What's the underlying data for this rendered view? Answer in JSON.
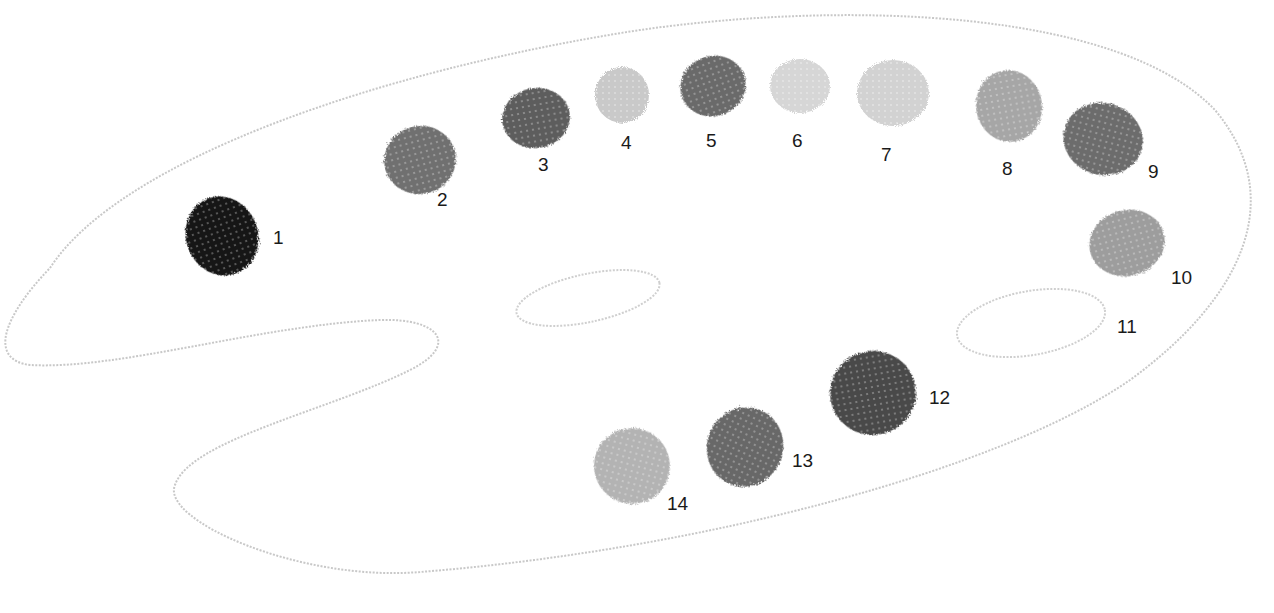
{
  "palette": {
    "outline_color": "#c8c8c8",
    "background": "#ffffff"
  },
  "swatches": [
    {
      "number": "1",
      "color": "#151515",
      "cx": 222,
      "cy": 236,
      "rx": 36,
      "ry": 40,
      "rot": -20,
      "label_x": 273,
      "label_y": 228
    },
    {
      "number": "2",
      "color": "#6f6f6f",
      "cx": 420,
      "cy": 160,
      "rx": 36,
      "ry": 34,
      "rot": -15,
      "label_x": 437,
      "label_y": 190
    },
    {
      "number": "3",
      "color": "#5d5d5d",
      "cx": 536,
      "cy": 118,
      "rx": 34,
      "ry": 30,
      "rot": -10,
      "label_x": 538,
      "label_y": 155
    },
    {
      "number": "4",
      "color": "#c9c9c9",
      "cx": 622,
      "cy": 95,
      "rx": 27,
      "ry": 28,
      "rot": 0,
      "label_x": 621,
      "label_y": 133
    },
    {
      "number": "5",
      "color": "#6a6a6a",
      "cx": 713,
      "cy": 86,
      "rx": 33,
      "ry": 30,
      "rot": -20,
      "label_x": 706,
      "label_y": 131
    },
    {
      "number": "6",
      "color": "#d6d6d6",
      "cx": 800,
      "cy": 86,
      "rx": 30,
      "ry": 27,
      "rot": 0,
      "label_x": 792,
      "label_y": 131
    },
    {
      "number": "7",
      "color": "#d2d2d2",
      "cx": 893,
      "cy": 93,
      "rx": 36,
      "ry": 33,
      "rot": 0,
      "label_x": 881,
      "label_y": 145
    },
    {
      "number": "8",
      "color": "#a6a6a6",
      "cx": 1009,
      "cy": 106,
      "rx": 33,
      "ry": 36,
      "rot": -10,
      "label_x": 1002,
      "label_y": 159
    },
    {
      "number": "9",
      "color": "#6c6c6c",
      "cx": 1103,
      "cy": 139,
      "rx": 40,
      "ry": 36,
      "rot": 15,
      "label_x": 1148,
      "label_y": 162
    },
    {
      "number": "10",
      "color": "#9d9d9d",
      "cx": 1127,
      "cy": 243,
      "rx": 38,
      "ry": 33,
      "rot": -15,
      "label_x": 1171,
      "label_y": 268
    },
    {
      "number": "12",
      "color": "#484848",
      "cx": 873,
      "cy": 393,
      "rx": 43,
      "ry": 42,
      "rot": -10,
      "label_x": 929,
      "label_y": 388
    },
    {
      "number": "13",
      "color": "#676767",
      "cx": 745,
      "cy": 447,
      "rx": 38,
      "ry": 40,
      "rot": 25,
      "label_x": 792,
      "label_y": 451
    },
    {
      "number": "14",
      "color": "#b3b3b3",
      "cx": 632,
      "cy": 466,
      "rx": 38,
      "ry": 38,
      "rot": 15,
      "label_x": 667,
      "label_y": 494
    }
  ],
  "empty_well": {
    "number": "11",
    "label_x": 1117,
    "label_y": 317
  },
  "labels": [
    "1",
    "2",
    "3",
    "4",
    "5",
    "6",
    "7",
    "8",
    "9",
    "10",
    "11",
    "12",
    "13",
    "14"
  ]
}
